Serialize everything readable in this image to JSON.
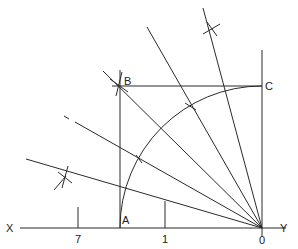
{
  "diagram": {
    "type": "geometric-construction",
    "colors": {
      "line": "#2a2a2a",
      "background": "#ffffff",
      "text": "#222222"
    },
    "labels": {
      "X": "X",
      "Y": "Y",
      "O": "0",
      "A": "A",
      "B": "B",
      "C": "C",
      "seven": "7",
      "one": "1"
    },
    "points": {
      "O": [
        262,
        228
      ],
      "A": [
        120,
        228
      ],
      "B": [
        120,
        86
      ],
      "C": [
        262,
        86
      ]
    },
    "radius_arc": 142
  }
}
